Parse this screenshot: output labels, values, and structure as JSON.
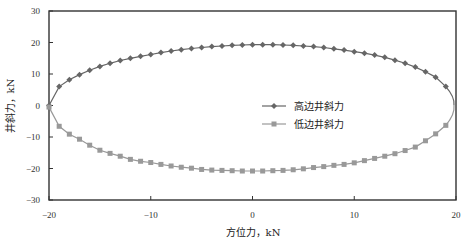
{
  "chart_data": {
    "type": "line",
    "title": "",
    "xlabel": "方位力，kN",
    "ylabel": "井斜力，kN",
    "xlim": [
      -20,
      20
    ],
    "ylim": [
      -30,
      30
    ],
    "xticks": [
      -20,
      -10,
      0,
      10,
      20
    ],
    "yticks": [
      30,
      20,
      10,
      0,
      -10,
      -20,
      -30
    ],
    "xtick_labels": [
      "−20",
      "−10",
      "0",
      "10",
      "20"
    ],
    "ytick_labels": [
      "30",
      "20",
      "10",
      "0",
      "−10",
      "−20",
      "−30"
    ],
    "grid": false,
    "legend_position": "center-right",
    "x": [
      -20,
      -19,
      -18,
      -17,
      -16,
      -15,
      -14,
      -13,
      -12,
      -11,
      -10,
      -9,
      -8,
      -7,
      -6,
      -5,
      -4,
      -3,
      -2,
      -1,
      0,
      1,
      2,
      3,
      4,
      5,
      6,
      7,
      8,
      9,
      10,
      11,
      12,
      13,
      14,
      15,
      16,
      17,
      18,
      19
    ],
    "series": [
      {
        "name": "高边井斜力",
        "marker": "diamond",
        "color": "#666666",
        "values": [
          0,
          6.0,
          8.2,
          9.8,
          11.2,
          12.4,
          13.4,
          14.3,
          15.0,
          15.6,
          16.2,
          16.8,
          17.3,
          17.7,
          18.1,
          18.4,
          18.7,
          18.9,
          19.1,
          19.2,
          19.3,
          19.3,
          19.3,
          19.2,
          19.1,
          18.9,
          18.7,
          18.4,
          18.0,
          17.6,
          17.1,
          16.6,
          16.0,
          15.3,
          14.4,
          13.4,
          12.2,
          10.7,
          9.0,
          6.0
        ],
        "closing_point": [
          20,
          0
        ]
      },
      {
        "name": "低边井斜力",
        "marker": "square",
        "color": "#999999",
        "values": [
          -0.5,
          -6.6,
          -9.1,
          -10.7,
          -12.6,
          -14.2,
          -15.2,
          -16.1,
          -17.1,
          -17.7,
          -18.1,
          -18.7,
          -19.2,
          -19.6,
          -19.9,
          -20.3,
          -20.5,
          -20.6,
          -20.7,
          -20.8,
          -20.8,
          -20.8,
          -20.7,
          -20.6,
          -20.4,
          -20.1,
          -19.7,
          -19.4,
          -19.0,
          -18.7,
          -18.2,
          -17.5,
          -16.8,
          -16.1,
          -15.3,
          -14.3,
          -13.2,
          -11.2,
          -9.0,
          -6.3
        ],
        "closing_point": [
          20,
          0
        ]
      }
    ]
  }
}
